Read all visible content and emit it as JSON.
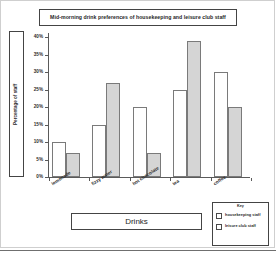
{
  "chart_data": {
    "type": "bar",
    "title": "Mid-morning drink preferences of housekeeping and leisure club staff",
    "xlabel": "Drinks",
    "ylabel": "Percentage of staff",
    "categories": [
      "lemonade",
      "fizzy water",
      "hot chocolate",
      "tea",
      "coffee"
    ],
    "series": [
      {
        "name": "housekeeping staff",
        "values": [
          10,
          15,
          20,
          25,
          30
        ],
        "color": "#ffffff"
      },
      {
        "name": "leisure club staff",
        "values": [
          7,
          27,
          7,
          39,
          20
        ],
        "color": "#d5d5d5"
      }
    ],
    "ylim": [
      0,
      40
    ],
    "ytick_labels": [
      "0%",
      "5%",
      "10%",
      "15%",
      "20%",
      "25%",
      "30%",
      "35%",
      "40%"
    ],
    "ytick_values": [
      0,
      5,
      10,
      15,
      20,
      25,
      30,
      35,
      40
    ],
    "grid": false,
    "legend_position": "bottom-right",
    "legend_title": "Key"
  },
  "legend": {
    "title": "Key",
    "entries": [
      {
        "label": "housekeeping staff"
      },
      {
        "label": "leisure club staff"
      }
    ]
  }
}
